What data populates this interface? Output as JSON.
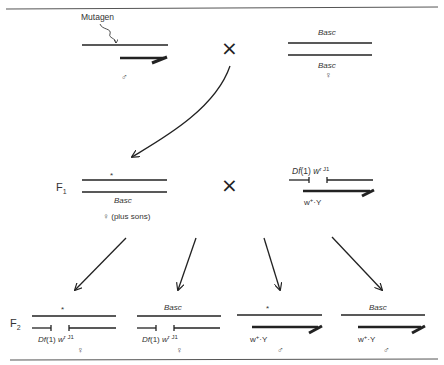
{
  "parental": {
    "male": {
      "mutagen_label": "Mutagen",
      "symbol": "♂"
    },
    "cross_symbol": "×",
    "female": {
      "top_label": "Basc",
      "bottom_label": "Basc",
      "symbol": "♀"
    }
  },
  "f1": {
    "generation_label": "F",
    "generation_sub": "1",
    "female": {
      "mark": "*",
      "bottom_label": "Basc",
      "symbol_text": "♀ (plus sons)"
    },
    "cross_symbol": "×",
    "male": {
      "df_label_italic": "Df",
      "df_label_mid": "(1) ",
      "df_label_w": "w",
      "df_label_sup": "r J1",
      "y_label_w": "w",
      "y_label_sup": "+",
      "y_label_rest": "·Y"
    }
  },
  "f2": {
    "generation_label": "F",
    "generation_sub": "2",
    "progeny": [
      {
        "top": "*",
        "df_italic": "Df",
        "df_mid": "(1) ",
        "df_w": "w",
        "df_sup": "r J1",
        "symbol": "♀"
      },
      {
        "top": "Basc",
        "df_italic": "Df",
        "df_mid": "(1) ",
        "df_w": "w",
        "df_sup": "r J1",
        "symbol": "♀"
      },
      {
        "top": "*",
        "y_w": "w",
        "y_sup": "+",
        "y_rest": "·Y",
        "symbol": "♂"
      },
      {
        "top": "Basc",
        "y_w": "w",
        "y_sup": "+",
        "y_rest": "·Y",
        "symbol": "♂"
      }
    ]
  },
  "colors": {
    "ink": "#222222",
    "rule": "#555555",
    "background": "#ffffff"
  }
}
